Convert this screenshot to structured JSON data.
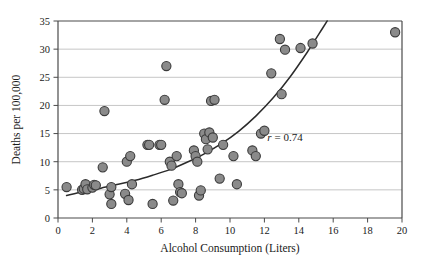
{
  "chart_data": {
    "type": "scatter",
    "title": "",
    "xlabel": "Alcohol Consumption (Liters)",
    "ylabel": "Deaths per 100,000",
    "xlim": [
      0,
      20
    ],
    "ylim": [
      0,
      35
    ],
    "xticks": [
      0,
      2,
      4,
      6,
      8,
      10,
      12,
      14,
      16,
      18,
      20
    ],
    "yticks": [
      0,
      5,
      10,
      15,
      20,
      25,
      30,
      35
    ],
    "grid": "horizontal",
    "legend": "none",
    "annotations": [
      {
        "name": "correlation-annotation",
        "symbol": "r",
        "text": "= 0.74",
        "full_text": "r = 0.74",
        "x": 13.2,
        "y": 13.6
      }
    ],
    "marker": {
      "shape": "circle",
      "fill": "#8a8a8a",
      "edge": "#3b3b3b",
      "size": 4.6
    },
    "points": [
      {
        "x": 0.5,
        "y": 5.5
      },
      {
        "x": 1.4,
        "y": 5.0
      },
      {
        "x": 1.5,
        "y": 5.2
      },
      {
        "x": 1.6,
        "y": 6.0
      },
      {
        "x": 1.7,
        "y": 5.1
      },
      {
        "x": 2.0,
        "y": 5.4
      },
      {
        "x": 2.1,
        "y": 5.9
      },
      {
        "x": 2.2,
        "y": 5.8
      },
      {
        "x": 2.6,
        "y": 9.0
      },
      {
        "x": 2.7,
        "y": 19.0
      },
      {
        "x": 3.0,
        "y": 4.2
      },
      {
        "x": 3.1,
        "y": 5.5
      },
      {
        "x": 3.1,
        "y": 2.5
      },
      {
        "x": 3.9,
        "y": 4.3
      },
      {
        "x": 4.0,
        "y": 10.0
      },
      {
        "x": 4.1,
        "y": 3.2
      },
      {
        "x": 4.2,
        "y": 11.0
      },
      {
        "x": 4.3,
        "y": 6.0
      },
      {
        "x": 5.2,
        "y": 13.0
      },
      {
        "x": 5.3,
        "y": 13.0
      },
      {
        "x": 5.5,
        "y": 2.5
      },
      {
        "x": 5.9,
        "y": 13.0
      },
      {
        "x": 6.0,
        "y": 13.0
      },
      {
        "x": 6.2,
        "y": 21.0
      },
      {
        "x": 6.3,
        "y": 27.0
      },
      {
        "x": 6.5,
        "y": 10.0
      },
      {
        "x": 6.6,
        "y": 9.3
      },
      {
        "x": 6.7,
        "y": 3.1
      },
      {
        "x": 6.9,
        "y": 11.0
      },
      {
        "x": 7.0,
        "y": 6.0
      },
      {
        "x": 7.1,
        "y": 4.6
      },
      {
        "x": 7.2,
        "y": 4.4
      },
      {
        "x": 7.9,
        "y": 12.0
      },
      {
        "x": 8.0,
        "y": 11.0
      },
      {
        "x": 8.1,
        "y": 10.0
      },
      {
        "x": 8.2,
        "y": 4.0
      },
      {
        "x": 8.3,
        "y": 4.9
      },
      {
        "x": 8.5,
        "y": 15.0
      },
      {
        "x": 8.6,
        "y": 14.0
      },
      {
        "x": 8.7,
        "y": 12.2
      },
      {
        "x": 8.8,
        "y": 15.2
      },
      {
        "x": 8.9,
        "y": 20.8
      },
      {
        "x": 9.0,
        "y": 14.3
      },
      {
        "x": 9.1,
        "y": 21.0
      },
      {
        "x": 9.4,
        "y": 7.0
      },
      {
        "x": 9.6,
        "y": 13.0
      },
      {
        "x": 10.2,
        "y": 11.0
      },
      {
        "x": 10.4,
        "y": 6.0
      },
      {
        "x": 11.3,
        "y": 12.0
      },
      {
        "x": 11.5,
        "y": 11.0
      },
      {
        "x": 11.8,
        "y": 15.0
      },
      {
        "x": 12.0,
        "y": 15.5
      },
      {
        "x": 12.4,
        "y": 25.7
      },
      {
        "x": 12.9,
        "y": 31.8
      },
      {
        "x": 13.0,
        "y": 22.0
      },
      {
        "x": 13.2,
        "y": 29.9
      },
      {
        "x": 14.1,
        "y": 30.2
      },
      {
        "x": 14.8,
        "y": 31.0
      },
      {
        "x": 19.6,
        "y": 33.0
      }
    ],
    "fit_curve": {
      "name": "exponential-fit",
      "color": "#2b2b2b",
      "x_start": 0.5,
      "x_end": 15.9,
      "points": [
        {
          "x": 0.5,
          "y": 4.0
        },
        {
          "x": 1.5,
          "y": 4.7
        },
        {
          "x": 2.5,
          "y": 5.3
        },
        {
          "x": 3.5,
          "y": 6.0
        },
        {
          "x": 4.5,
          "y": 6.7
        },
        {
          "x": 5.5,
          "y": 7.6
        },
        {
          "x": 6.5,
          "y": 8.6
        },
        {
          "x": 7.5,
          "y": 9.9
        },
        {
          "x": 8.5,
          "y": 11.4
        },
        {
          "x": 9.5,
          "y": 13.2
        },
        {
          "x": 10.5,
          "y": 15.4
        },
        {
          "x": 11.5,
          "y": 18.1
        },
        {
          "x": 12.5,
          "y": 21.3
        },
        {
          "x": 13.5,
          "y": 25.1
        },
        {
          "x": 14.5,
          "y": 29.5
        },
        {
          "x": 15.4,
          "y": 33.8
        },
        {
          "x": 15.65,
          "y": 35.0
        }
      ]
    }
  },
  "caption": {
    "partial_text": ""
  }
}
